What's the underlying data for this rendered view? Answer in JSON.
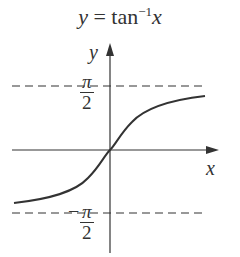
{
  "title": {
    "lhs": "y",
    "eq": " = tan",
    "sup": "−1",
    "rhs": "x"
  },
  "axes": {
    "x_label": "x",
    "y_label": "y"
  },
  "asymptotes": {
    "upper": {
      "num": "π",
      "den": "2",
      "sign": ""
    },
    "lower": {
      "num": "π",
      "den": "2",
      "sign": "−"
    }
  },
  "colors": {
    "stroke": "#333333",
    "background": "#ffffff"
  }
}
